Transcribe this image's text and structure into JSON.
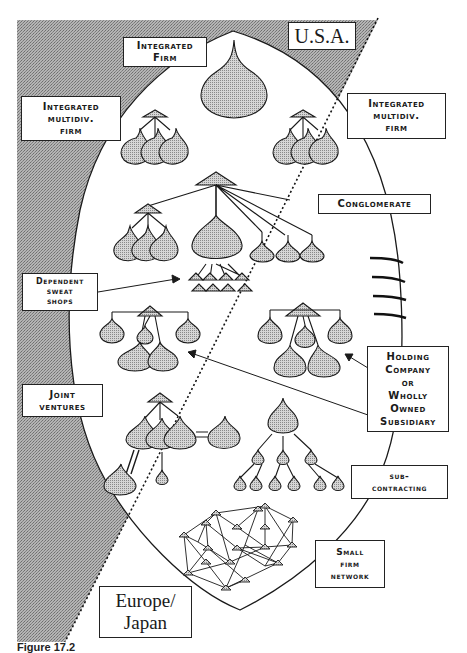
{
  "diagram": {
    "regions": {
      "top": "U.S.A.",
      "bottom_line1": "Europe/",
      "bottom_line2": "Japan"
    },
    "labels": {
      "integrated_firm": [
        "Integrated",
        "Firm"
      ],
      "integrated_multidiv_left": [
        "Integrated",
        "multidiv.",
        "firm"
      ],
      "integrated_multidiv_right": [
        "Integrated",
        "multidiv.",
        "firm"
      ],
      "conglomerate": [
        "Conglomerate"
      ],
      "dependent_sweat_shops": [
        "Dependent",
        "sweat",
        "shops"
      ],
      "holding_company": [
        "Holding",
        "Company",
        "or",
        "Wholly",
        "Owned",
        "Subsidiary"
      ],
      "joint_ventures": [
        "Joint",
        "ventures"
      ],
      "sub_contracting": [
        "sub-",
        "contracting"
      ],
      "small_firm_network": [
        "Small",
        "firm",
        "network"
      ]
    },
    "caption": "Figure 17.2",
    "colors": {
      "shade": "#9a9a9a",
      "blob": "#c8c8c8",
      "line": "#1a1a1a",
      "background": "#ffffff"
    }
  }
}
